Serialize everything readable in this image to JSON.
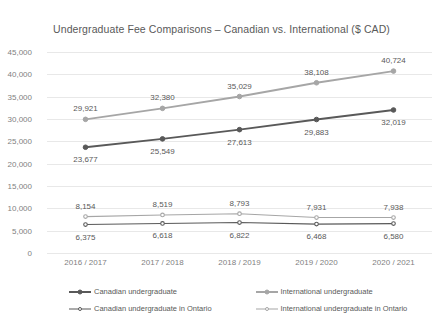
{
  "chart_data": {
    "type": "line",
    "title": "Undergraduate Fee Comparisons – Canadian vs. International ($ CAD)",
    "xlabel": "",
    "ylabel": "",
    "ylim": [
      0,
      45000
    ],
    "ytick_labels": [
      "45,000",
      "40,000",
      "35,000",
      "30,000",
      "25,000",
      "20,000",
      "15,000",
      "10,000",
      "5,000",
      "0"
    ],
    "ytick_values": [
      45000,
      40000,
      35000,
      30000,
      25000,
      20000,
      15000,
      10000,
      5000,
      0
    ],
    "grid": true,
    "legend_position": "bottom",
    "categories": [
      "2016 / 2017",
      "2017 / 2018",
      "2018 / 2019",
      "2019 / 2020",
      "2020 / 2021"
    ],
    "series": [
      {
        "name": "Canadian undergraduate",
        "color": "#595959",
        "values": [
          23677,
          25549,
          27613,
          29883,
          32019
        ],
        "labels": [
          "23,677",
          "25,549",
          "27,613",
          "29,883",
          "32,019"
        ],
        "label_side": "below"
      },
      {
        "name": "International undergraduate",
        "color": "#a6a6a6",
        "values": [
          29921,
          32380,
          35029,
          38108,
          40724
        ],
        "labels": [
          "29,921",
          "32,380",
          "35,029",
          "38,108",
          "40,724"
        ],
        "label_side": "above"
      },
      {
        "name": "Canadian undergraduate in Ontario",
        "color": "#595959",
        "values": [
          6375,
          6618,
          6822,
          6468,
          6580
        ],
        "labels": [
          "6,375",
          "6,618",
          "6,822",
          "6,468",
          "6,580"
        ],
        "label_side": "below"
      },
      {
        "name": "International undergraduate in Ontario",
        "color": "#a6a6a6",
        "values": [
          8154,
          8519,
          8793,
          7931,
          7938
        ],
        "labels": [
          "8,154",
          "8,519",
          "8,793",
          "7,931",
          "7,938"
        ],
        "label_side": "above"
      }
    ]
  }
}
